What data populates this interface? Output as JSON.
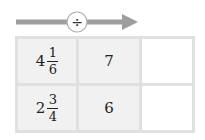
{
  "operator": {
    "symbol": "÷",
    "name": "divide"
  },
  "colors": {
    "arrow": "#9e9e9e",
    "cell_fill": "#f1f1f1",
    "grid_line": "#e0e0e0",
    "blank_fill": "#ffffff"
  },
  "rows": [
    {
      "dividend": {
        "whole": "4",
        "numerator": "1",
        "denominator": "6"
      },
      "divisor": "7",
      "result": ""
    },
    {
      "dividend": {
        "whole": "2",
        "numerator": "3",
        "denominator": "4"
      },
      "divisor": "6",
      "result": ""
    }
  ]
}
